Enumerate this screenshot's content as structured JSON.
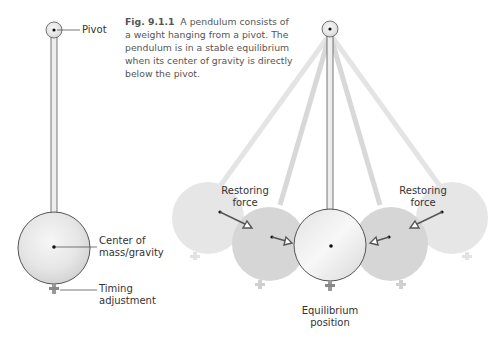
{
  "figure": {
    "number": "Fig. 9.1.1",
    "caption": "A pendulum consists of a weight hanging from a pivot. The pendulum is in a stable equilibrium when its center of gravity is directly below the pivot."
  },
  "left_diagram": {
    "labels": {
      "pivot": "Pivot",
      "center_line1": "Center of",
      "center_line2": "mass/gravity",
      "timing_line1": "Timing",
      "timing_line2": "adjustment"
    }
  },
  "right_diagram": {
    "labels": {
      "restoring_left_line1": "Restoring",
      "restoring_left_line2": "force",
      "restoring_right_line1": "Restoring",
      "restoring_right_line2": "force",
      "equilibrium_line1": "Equilibrium",
      "equilibrium_line2": "position"
    }
  },
  "colors": {
    "bob_main": "#e8e8e8",
    "bob_outline": "#555555",
    "bob_ghost_near": "#d6d6d6",
    "bob_ghost_far": "#e6e6e6",
    "arrow": "#555555"
  }
}
